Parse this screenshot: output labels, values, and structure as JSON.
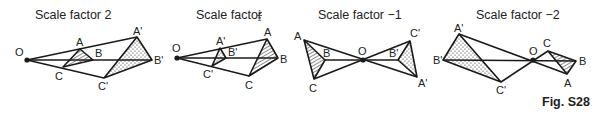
{
  "figure": {
    "caption": "Fig. S28",
    "panels": [
      {
        "title": "Scale factor 2",
        "scale_factor": "2",
        "labels": {
          "O": "O",
          "A": "A",
          "B": "B",
          "C": "C",
          "A1": "A'",
          "B1": "B'",
          "C1": "C'"
        }
      },
      {
        "title": "Scale factor",
        "scale_factor": "1/2",
        "fraction_num": "1",
        "fraction_den": "2",
        "labels": {
          "O": "O",
          "A": "A",
          "B": "B",
          "C": "C",
          "A1": "A'",
          "B1": "B'",
          "C1": "C'"
        }
      },
      {
        "title": "Scale factor −1",
        "scale_factor": "-1",
        "labels": {
          "O": "O",
          "A": "A",
          "B": "B",
          "C": "C",
          "A1": "A'",
          "B1": "B'",
          "C1": "C'"
        }
      },
      {
        "title": "Scale factor −2",
        "scale_factor": "-2",
        "labels": {
          "O": "O",
          "A": "A",
          "B": "B",
          "C": "C",
          "A1": "A'",
          "B1": "B'",
          "C1": "C'"
        }
      }
    ],
    "legend": {
      "object_fill": "hatched",
      "image_fill": "dotted"
    }
  }
}
